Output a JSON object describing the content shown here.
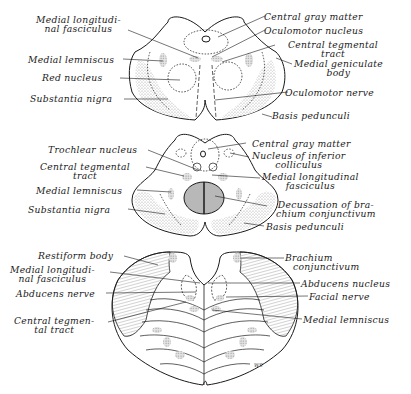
{
  "figure": {
    "signature": "WS",
    "colors": {
      "ink": "#1a1a1a",
      "stipple": "#d8d8d8",
      "hatch": "#555555",
      "background": "#ffffff"
    }
  },
  "sections": [
    {
      "name": "midbrain-superior-colliculus-level",
      "labels_left": [
        {
          "line1": "Medial longitudi-",
          "line2": "nal fasciculus"
        },
        {
          "line1": "Medial lemniscus"
        },
        {
          "line1": "Red nucleus"
        },
        {
          "line1": "Substantia nigra"
        }
      ],
      "labels_right": [
        {
          "line1": "Central gray matter"
        },
        {
          "line1": "Oculomotor nucleus"
        },
        {
          "line1": "Central tegmental",
          "line2": "tract"
        },
        {
          "line1": "Medial geniculate",
          "line2": "body"
        },
        {
          "line1": "Oculomotor nerve"
        },
        {
          "line1": "Basis pedunculi"
        }
      ]
    },
    {
      "name": "midbrain-inferior-colliculus-level",
      "labels_left": [
        {
          "line1": "Trochlear nucleus"
        },
        {
          "line1": "Central tegmental",
          "line2": "tract"
        },
        {
          "line1": "Medial lemniscus"
        },
        {
          "line1": "Substantia nigra"
        }
      ],
      "labels_right": [
        {
          "line1": "Central gray matter"
        },
        {
          "line1": "Nucleus of inferior",
          "line2": "colliculus"
        },
        {
          "line1": "Medial longitudinal",
          "line2": "fasciculus"
        },
        {
          "line1": "Decussation of bra-",
          "line2": "chium conjunctivum"
        },
        {
          "line1": "Basis pedunculi"
        }
      ]
    },
    {
      "name": "pons-level",
      "labels_left": [
        {
          "line1": "Restiform body"
        },
        {
          "line1": "Medial longitudi-",
          "line2": "nal fasciculus"
        },
        {
          "line1": "Abducens nerve"
        },
        {
          "line1": "Central tegmen-",
          "line2": "tal tract"
        }
      ],
      "labels_right": [
        {
          "line1": "Brachium",
          "line2": "conjunctivum"
        },
        {
          "line1": "Abducens nucleus"
        },
        {
          "line1": "Facial nerve"
        },
        {
          "line1": "Medial lemniscus"
        }
      ]
    }
  ]
}
